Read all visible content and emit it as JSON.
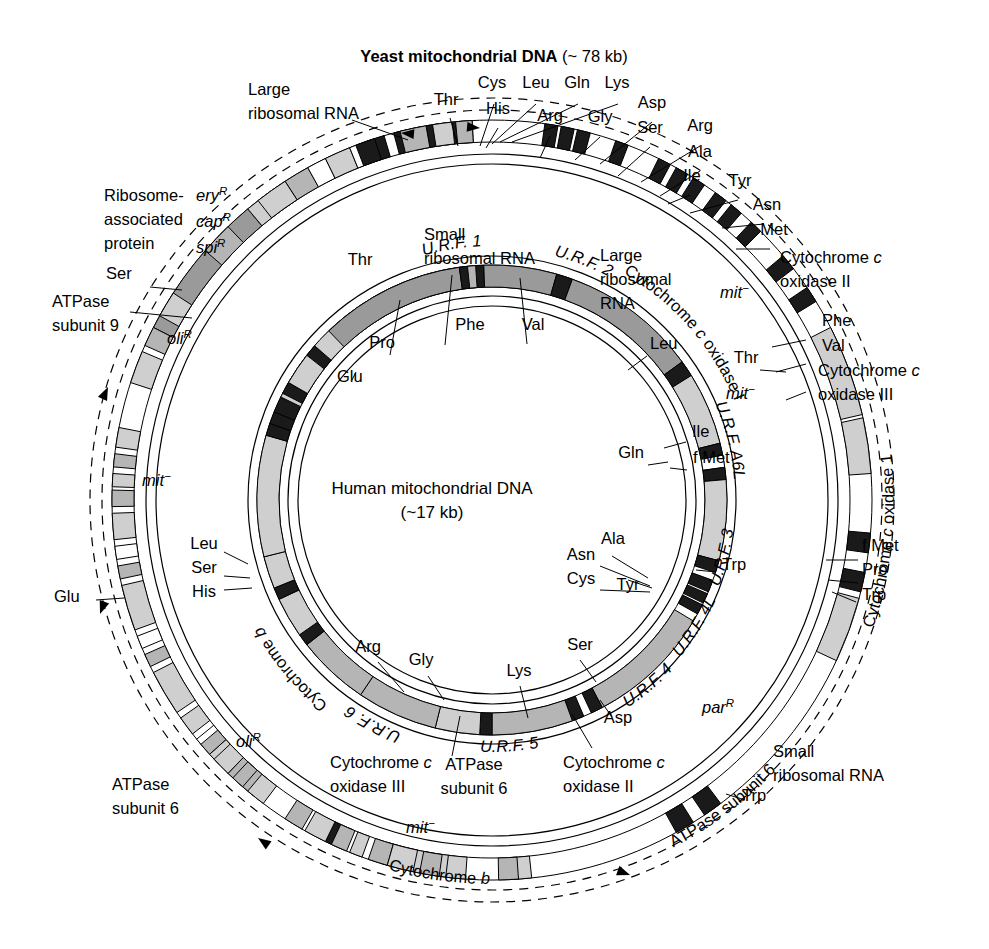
{
  "figure": {
    "title_bold": "Yeast mitochondrial DNA",
    "title_size": "(~ 78 kb)",
    "center_title": "Human mitochondrial DNA",
    "center_size": "(~17 kb)",
    "colors": {
      "dark_gene": "#9a9a9a",
      "mid_gene": "#b5b5b5",
      "light_gene": "#cfcfcf",
      "trna_black": "#1a1a1a",
      "outline": "#000000",
      "background": "#ffffff"
    }
  },
  "chart_data": {
    "type": "diagram",
    "maps": [
      {
        "name": "yeast",
        "genome_size": "~ 78 kb",
        "genes": [
          "Large ribosomal RNA",
          "Ribosome-associated protein",
          "ATPase subunit 9",
          "Cytochrome b",
          "ATPase subunit 6",
          "Cytochrome c oxidase 1",
          "Small ribosomal RNA",
          "Cytochrome c oxidase II",
          "Cytochrome c oxidase III"
        ],
        "trnas": [
          "Thr",
          "Cys",
          "His",
          "Leu",
          "Gln",
          "Lys",
          "Arg",
          "Gly",
          "Asp",
          "Ser",
          "Arg",
          "Ala",
          "Ile",
          "Tyr",
          "Asn",
          "Met",
          "Phe",
          "Val",
          "f Met",
          "Pro",
          "Trp",
          "Trp",
          "Glu",
          "Ser"
        ],
        "markers": [
          "ery R",
          "cap R",
          "spi R",
          "oli R",
          "oli R",
          "mit -",
          "mit -",
          "mit -",
          "mit -",
          "par R"
        ]
      },
      {
        "name": "human",
        "genome_size": "~17 kb",
        "genes": [
          "Small ribosomal RNA",
          "Large ribosomal RNA",
          "U.R.F. 1",
          "U.R.F. 2",
          "Cytochrome c oxidase I",
          "Cytochrome c oxidase II",
          "ATPase subunit 6",
          "U.R.F. A6L",
          "Cytochrome c oxidase III",
          "U.R.F. 3",
          "U.R.F. 4L",
          "U.R.F. 4",
          "U.R.F. 5",
          "Cytochrome b",
          "U.R.F. 6"
        ],
        "trnas": [
          "Phe",
          "Val",
          "Leu",
          "Ile",
          "f Met",
          "Gln",
          "Trp",
          "Ala",
          "Asn",
          "Cys",
          "Tyr",
          "Ser",
          "Asp",
          "Lys",
          "Gly",
          "Arg",
          "His",
          "Ser",
          "Leu",
          "Thr",
          "Pro",
          "Glu"
        ]
      }
    ]
  },
  "yeast_labels": [
    {
      "id": "large-ribosomal-rna",
      "lines": [
        "Large",
        "ribosomal RNA"
      ],
      "x": 248,
      "y": 95,
      "anchor": "start",
      "style": "plain"
    },
    {
      "id": "thr",
      "lines": [
        "Thr"
      ],
      "x": 446,
      "y": 105,
      "anchor": "middle",
      "style": "plain"
    },
    {
      "id": "cys",
      "lines": [
        "Cys"
      ],
      "x": 492,
      "y": 88,
      "anchor": "middle",
      "style": "plain"
    },
    {
      "id": "leu",
      "lines": [
        "Leu"
      ],
      "x": 536,
      "y": 88,
      "anchor": "middle",
      "style": "plain"
    },
    {
      "id": "gln",
      "lines": [
        "Gln"
      ],
      "x": 577,
      "y": 88,
      "anchor": "middle",
      "style": "plain"
    },
    {
      "id": "lys",
      "lines": [
        "Lys"
      ],
      "x": 617,
      "y": 88,
      "anchor": "middle",
      "style": "plain"
    },
    {
      "id": "his",
      "lines": [
        "His"
      ],
      "x": 498,
      "y": 114,
      "anchor": "middle",
      "style": "plain"
    },
    {
      "id": "arg-1",
      "lines": [
        "Arg"
      ],
      "x": 550,
      "y": 121,
      "anchor": "middle",
      "style": "plain"
    },
    {
      "id": "gly",
      "lines": [
        "Gly"
      ],
      "x": 600,
      "y": 122,
      "anchor": "middle",
      "style": "plain"
    },
    {
      "id": "asp",
      "lines": [
        "Asp"
      ],
      "x": 652,
      "y": 108,
      "anchor": "middle",
      "style": "plain"
    },
    {
      "id": "ser-1",
      "lines": [
        "Ser"
      ],
      "x": 650,
      "y": 133,
      "anchor": "middle",
      "style": "plain"
    },
    {
      "id": "arg-2",
      "lines": [
        "Arg"
      ],
      "x": 700,
      "y": 131,
      "anchor": "middle",
      "style": "plain"
    },
    {
      "id": "ala",
      "lines": [
        "Ala"
      ],
      "x": 700,
      "y": 157,
      "anchor": "middle",
      "style": "plain"
    },
    {
      "id": "ile",
      "lines": [
        "Ile"
      ],
      "x": 692,
      "y": 181,
      "anchor": "middle",
      "style": "plain"
    },
    {
      "id": "tyr",
      "lines": [
        "Tyr"
      ],
      "x": 740,
      "y": 186,
      "anchor": "middle",
      "style": "plain"
    },
    {
      "id": "asn",
      "lines": [
        "Asn"
      ],
      "x": 767,
      "y": 210,
      "anchor": "middle",
      "style": "plain"
    },
    {
      "id": "met",
      "lines": [
        "Met"
      ],
      "x": 774,
      "y": 235,
      "anchor": "middle",
      "style": "plain"
    },
    {
      "id": "cox2",
      "lines": [
        "Cytochrome c",
        "oxidase II"
      ],
      "x": 780,
      "y": 263,
      "anchor": "start",
      "style": "cyto"
    },
    {
      "id": "phe-y",
      "lines": [
        "Phe"
      ],
      "x": 822,
      "y": 326,
      "anchor": "start",
      "style": "plain"
    },
    {
      "id": "val-y",
      "lines": [
        "Val"
      ],
      "x": 822,
      "y": 351,
      "anchor": "start",
      "style": "plain"
    },
    {
      "id": "thr-y2",
      "lines": [
        "Thr"
      ],
      "x": 746,
      "y": 363,
      "anchor": "middle",
      "style": "plain"
    },
    {
      "id": "cox3",
      "lines": [
        "Cytochrome c",
        "oxidase III"
      ],
      "x": 818,
      "y": 376,
      "anchor": "start",
      "style": "cyto"
    },
    {
      "id": "fmet-y",
      "lines": [
        "f Met"
      ],
      "x": 862,
      "y": 551,
      "anchor": "start",
      "style": "plain"
    },
    {
      "id": "pro-y",
      "lines": [
        "Pro"
      ],
      "x": 862,
      "y": 575,
      "anchor": "start",
      "style": "plain"
    },
    {
      "id": "trp-y",
      "lines": [
        "Trp"
      ],
      "x": 862,
      "y": 600,
      "anchor": "start",
      "style": "plain"
    },
    {
      "id": "parr",
      "lines": [
        "par"
      ],
      "sup": "R",
      "x": 702,
      "y": 713,
      "anchor": "start",
      "style": "ital"
    },
    {
      "id": "small-rrna-y",
      "lines": [
        "Small",
        "ribosomal RNA"
      ],
      "x": 773,
      "y": 757,
      "anchor": "start",
      "style": "plain"
    },
    {
      "id": "trp-y2",
      "lines": [
        "Trp"
      ],
      "x": 742,
      "y": 801,
      "anchor": "start",
      "style": "plain"
    },
    {
      "id": "ribosome-assoc",
      "lines": [
        "Ribosome-",
        "associated",
        "protein"
      ],
      "x": 104,
      "y": 201,
      "anchor": "start",
      "style": "plain"
    },
    {
      "id": "ser-y",
      "lines": [
        "Ser"
      ],
      "x": 106,
      "y": 279,
      "anchor": "start",
      "style": "plain"
    },
    {
      "id": "atpase9",
      "lines": [
        "ATPase",
        "subunit 9"
      ],
      "x": 52,
      "y": 307,
      "anchor": "start",
      "style": "plain"
    },
    {
      "id": "olir-1",
      "lines": [
        "oli"
      ],
      "sup": "R",
      "x": 167,
      "y": 344,
      "anchor": "start",
      "style": "ital"
    },
    {
      "id": "mit-1",
      "lines": [
        "mit"
      ],
      "sup": "−",
      "x": 142,
      "y": 486,
      "anchor": "start",
      "style": "ital"
    },
    {
      "id": "glu-y",
      "lines": [
        "Glu"
      ],
      "x": 54,
      "y": 602,
      "anchor": "start",
      "style": "plain"
    },
    {
      "id": "olir-2",
      "lines": [
        "oli"
      ],
      "sup": "R",
      "x": 236,
      "y": 747,
      "anchor": "start",
      "style": "ital"
    },
    {
      "id": "atpase6-y",
      "lines": [
        "ATPase",
        "subunit 6"
      ],
      "x": 112,
      "y": 790,
      "anchor": "start",
      "style": "plain"
    },
    {
      "id": "eryr",
      "lines": [
        "ery"
      ],
      "sup": "R",
      "x": 196,
      "y": 201,
      "anchor": "start",
      "style": "ital"
    },
    {
      "id": "capr",
      "lines": [
        "cap"
      ],
      "sup": "R",
      "x": 196,
      "y": 227,
      "anchor": "start",
      "style": "ital"
    },
    {
      "id": "spir",
      "lines": [
        "spi"
      ],
      "sup": "R",
      "x": 196,
      "y": 253,
      "anchor": "start",
      "style": "ital"
    },
    {
      "id": "mit-2",
      "lines": [
        "mit"
      ],
      "sup": "−",
      "x": 720,
      "y": 298,
      "anchor": "start",
      "style": "ital"
    },
    {
      "id": "mit-3",
      "lines": [
        "mit"
      ],
      "sup": "−",
      "x": 726,
      "y": 399,
      "anchor": "start",
      "style": "ital"
    },
    {
      "id": "mit-4",
      "lines": [
        "mit"
      ],
      "sup": "−",
      "x": 406,
      "y": 833,
      "anchor": "start",
      "style": "ital"
    }
  ],
  "human_labels": [
    {
      "id": "small-rrna-h",
      "lines": [
        "Small",
        "ribosomal RNA"
      ],
      "x": 424,
      "y": 240,
      "anchor": "start",
      "style": "plain"
    },
    {
      "id": "large-rrna-h",
      "lines": [
        "Large",
        "ribosomal",
        "RNA"
      ],
      "x": 600,
      "y": 261,
      "anchor": "start",
      "style": "plain"
    },
    {
      "id": "thr-h",
      "lines": [
        "Thr"
      ],
      "x": 360,
      "y": 265,
      "anchor": "middle",
      "style": "plain"
    },
    {
      "id": "phe-h",
      "lines": [
        "Phe"
      ],
      "x": 470,
      "y": 330,
      "anchor": "middle",
      "style": "plain"
    },
    {
      "id": "val-h",
      "lines": [
        "Val"
      ],
      "x": 533,
      "y": 330,
      "anchor": "middle",
      "style": "plain"
    },
    {
      "id": "pro-h",
      "lines": [
        "Pro"
      ],
      "x": 382,
      "y": 348,
      "anchor": "middle",
      "style": "plain"
    },
    {
      "id": "glu-h",
      "lines": [
        "Glu"
      ],
      "x": 337,
      "y": 382,
      "anchor": "start",
      "style": "plain"
    },
    {
      "id": "leu-h",
      "lines": [
        "Leu"
      ],
      "x": 650,
      "y": 349,
      "anchor": "start",
      "style": "plain"
    },
    {
      "id": "gln-h",
      "lines": [
        "Gln"
      ],
      "x": 631,
      "y": 458,
      "anchor": "middle",
      "style": "plain"
    },
    {
      "id": "ile-h",
      "lines": [
        "Ile"
      ],
      "x": 692,
      "y": 437,
      "anchor": "start",
      "style": "plain"
    },
    {
      "id": "fmet-h",
      "lines": [
        "f Met"
      ],
      "x": 693,
      "y": 463,
      "anchor": "start",
      "style": "plain"
    },
    {
      "id": "trp-h",
      "lines": [
        "Trp"
      ],
      "x": 722,
      "y": 570,
      "anchor": "start",
      "style": "plain"
    },
    {
      "id": "ala-h",
      "lines": [
        "Ala"
      ],
      "x": 613,
      "y": 544,
      "anchor": "middle",
      "style": "plain"
    },
    {
      "id": "asn-h",
      "lines": [
        "Asn"
      ],
      "x": 581,
      "y": 560,
      "anchor": "middle",
      "style": "plain"
    },
    {
      "id": "cys-h",
      "lines": [
        "Cys"
      ],
      "x": 581,
      "y": 584,
      "anchor": "middle",
      "style": "plain"
    },
    {
      "id": "tyr-h",
      "lines": [
        "Tyr"
      ],
      "x": 628,
      "y": 590,
      "anchor": "middle",
      "style": "plain"
    },
    {
      "id": "ser-h",
      "lines": [
        "Ser"
      ],
      "x": 580,
      "y": 650,
      "anchor": "middle",
      "style": "plain"
    },
    {
      "id": "asp-h",
      "lines": [
        "Asp"
      ],
      "x": 618,
      "y": 723,
      "anchor": "middle",
      "style": "plain"
    },
    {
      "id": "lys-h",
      "lines": [
        "Lys"
      ],
      "x": 519,
      "y": 676,
      "anchor": "middle",
      "style": "plain"
    },
    {
      "id": "arg-h",
      "lines": [
        "Arg"
      ],
      "x": 368,
      "y": 652,
      "anchor": "middle",
      "style": "plain"
    },
    {
      "id": "gly-h",
      "lines": [
        "Gly"
      ],
      "x": 421,
      "y": 665,
      "anchor": "middle",
      "style": "plain"
    },
    {
      "id": "leu-h2",
      "lines": [
        "Leu"
      ],
      "x": 204,
      "y": 549,
      "anchor": "middle",
      "style": "plain"
    },
    {
      "id": "ser-h2",
      "lines": [
        "Ser"
      ],
      "x": 204,
      "y": 573,
      "anchor": "middle",
      "style": "plain"
    },
    {
      "id": "his-h",
      "lines": [
        "His"
      ],
      "x": 204,
      "y": 597,
      "anchor": "middle",
      "style": "plain"
    },
    {
      "id": "cox3-h",
      "lines": [
        "Cytochrome c",
        "oxidase III"
      ],
      "x": 330,
      "y": 768,
      "anchor": "start",
      "style": "cyto"
    },
    {
      "id": "atpase6-h",
      "lines": [
        "ATPase",
        "subunit 6"
      ],
      "x": 474,
      "y": 770,
      "anchor": "middle",
      "style": "plain"
    },
    {
      "id": "cox2-h",
      "lines": [
        "Cytochrome c",
        "oxidase II"
      ],
      "x": 563,
      "y": 768,
      "anchor": "start",
      "style": "cyto"
    }
  ],
  "curved_labels": [
    {
      "id": "cytochrome-b-h",
      "text": "Cytochrome b",
      "angle": -130,
      "r": 262,
      "style": "plain"
    },
    {
      "id": "urf6",
      "text": "U.R.F. 6",
      "angle": -152,
      "r": 250,
      "style": "ital"
    },
    {
      "id": "urf5",
      "text": "U.R.F. 5",
      "angle": 176,
      "r": 252,
      "style": "ital"
    },
    {
      "id": "urf4",
      "text": "U.R.F. 4",
      "angle": 140,
      "r": 248,
      "style": "ital"
    },
    {
      "id": "urf4l",
      "text": "U.R.F. 4L",
      "angle": 122,
      "r": 245,
      "style": "ital"
    },
    {
      "id": "urf3",
      "text": "U.R.F. 3",
      "angle": 104,
      "r": 243,
      "style": "ital"
    },
    {
      "id": "urfa6l",
      "text": "U.R.F. A6L",
      "angle": 76,
      "r": 243,
      "style": "ital"
    },
    {
      "id": "cox1-h",
      "text": "Cytochrome c oxidase I",
      "angle": 49,
      "r": 262,
      "style": "cyto"
    },
    {
      "id": "urf2",
      "text": "U.R.F. 2",
      "angle": 21,
      "r": 252,
      "style": "ital"
    },
    {
      "id": "urf1",
      "text": "U.R.F. 1",
      "angle": -9,
      "r": 254,
      "style": "ital"
    },
    {
      "id": "cytochrome-b-y",
      "text": "Cytochrome b",
      "angle": 188,
      "r": 384,
      "style": "plain"
    },
    {
      "id": "atpase6-y-curved",
      "text": "ATPase subunit 6",
      "angle": 143,
      "r": 392,
      "style": "plain"
    },
    {
      "id": "cox1-y",
      "text": "Cytochrome  c  oxidase 1",
      "angle": 96,
      "r": 402,
      "style": "cyto"
    }
  ]
}
